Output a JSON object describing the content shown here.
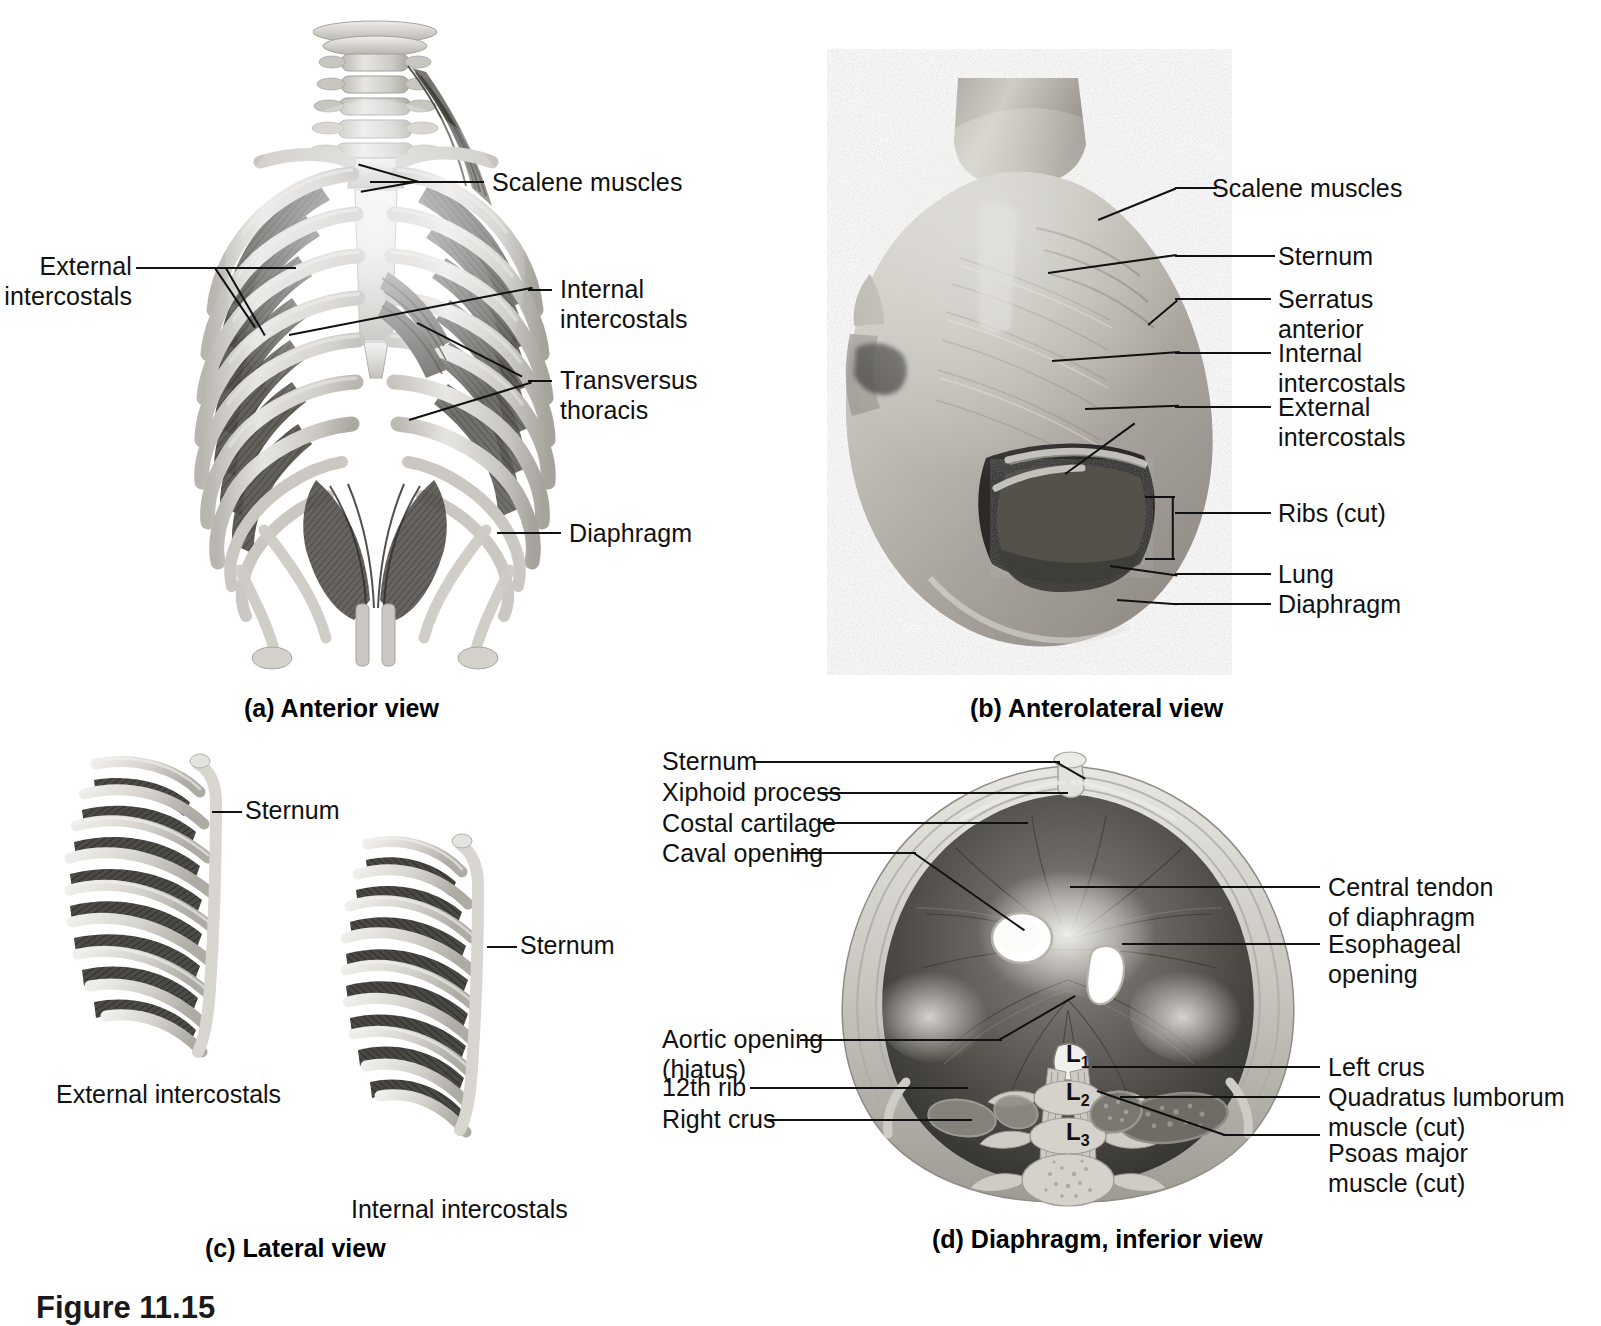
{
  "figure": {
    "number_text": "Figure 11.15"
  },
  "panels": [
    {
      "id": "a",
      "caption": "(a) Anterior view",
      "type": "illustration",
      "labels": [
        {
          "name": "scalene-muscles",
          "text": "Scalene muscles"
        },
        {
          "name": "external-intercostals",
          "text": "External\nintercostals"
        },
        {
          "name": "internal-intercostals",
          "text": "Internal\nintercostals"
        },
        {
          "name": "transversus-thoracis",
          "text": "Transversus\nthoracis"
        },
        {
          "name": "diaphragm",
          "text": "Diaphragm"
        }
      ]
    },
    {
      "id": "b",
      "caption": "(b) Anterolateral view",
      "type": "cadaver-photograph",
      "labels": [
        {
          "name": "scalene-muscles",
          "text": "Scalene muscles"
        },
        {
          "name": "sternum",
          "text": "Sternum"
        },
        {
          "name": "serratus-anterior",
          "text": "Serratus\nanterior"
        },
        {
          "name": "internal-intercostals",
          "text": "Internal\nintercostals"
        },
        {
          "name": "external-intercostals",
          "text": "External\nintercostals"
        },
        {
          "name": "ribs-cut",
          "text": "Ribs (cut)"
        },
        {
          "name": "lung",
          "text": "Lung"
        },
        {
          "name": "diaphragm",
          "text": "Diaphragm"
        }
      ]
    },
    {
      "id": "c",
      "caption": "(c) Lateral view",
      "type": "illustration",
      "labels": [
        {
          "name": "sternum-left",
          "text": "Sternum"
        },
        {
          "name": "sternum-right",
          "text": "Sternum"
        },
        {
          "name": "external-intercostals",
          "text": "External intercostals"
        },
        {
          "name": "internal-intercostals",
          "text": "Internal intercostals"
        }
      ]
    },
    {
      "id": "d",
      "caption": "(d) Diaphragm, inferior view",
      "type": "illustration",
      "labels_left": [
        {
          "name": "sternum",
          "text": "Sternum"
        },
        {
          "name": "xiphoid-process",
          "text": "Xiphoid process"
        },
        {
          "name": "costal-cartilage",
          "text": "Costal cartilage"
        },
        {
          "name": "caval-opening",
          "text": "Caval opening"
        },
        {
          "name": "aortic-opening",
          "text": "Aortic opening\n(hiatus)"
        },
        {
          "name": "twelfth-rib",
          "text": "12th rib"
        },
        {
          "name": "right-crus",
          "text": "Right crus"
        }
      ],
      "labels_right": [
        {
          "name": "central-tendon",
          "text": "Central tendon\nof diaphragm"
        },
        {
          "name": "esophageal-opening",
          "text": "Esophageal\nopening"
        },
        {
          "name": "left-crus",
          "text": "Left crus"
        },
        {
          "name": "quadratus-lumborum",
          "text": "Quadratus lumborum\nmuscle (cut)"
        },
        {
          "name": "psoas-major",
          "text": "Psoas major\nmuscle (cut)"
        }
      ],
      "vertebrae": [
        {
          "name": "vertebra-l1",
          "letter": "L",
          "num": "1"
        },
        {
          "name": "vertebra-l2",
          "letter": "L",
          "num": "2"
        },
        {
          "name": "vertebra-l3",
          "letter": "L",
          "num": "3"
        }
      ]
    }
  ],
  "colors": {
    "background": "#ffffff",
    "text": "#101010",
    "leader_line": "#111111",
    "bone_light": "#d8d6d2",
    "bone_mid": "#b6b3ae",
    "muscle_dark": "#4a4845",
    "muscle_mid": "#7d7a75",
    "tissue_light": "#c9c6c1"
  }
}
